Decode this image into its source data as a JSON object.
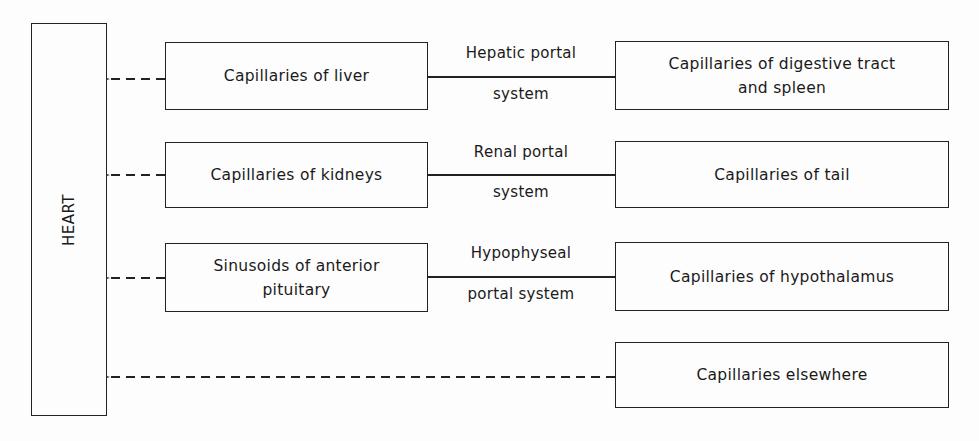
{
  "diagram": {
    "heart": {
      "label": "HEART"
    },
    "rows": [
      {
        "source": "Capillaries of liver",
        "system_top": "Hepatic portal",
        "system_bottom": "system",
        "origin": "Capillaries of digestive tract and spleen"
      },
      {
        "source": "Capillaries of kidneys",
        "system_top": "Renal portal",
        "system_bottom": "system",
        "origin": "Capillaries of tail"
      },
      {
        "source": "Sinusoids of anterior pituitary",
        "system_top": "Hypophyseal",
        "system_bottom": "portal system",
        "origin": "Capillaries of hypothalamus"
      },
      {
        "origin": "Capillaries elsewhere"
      }
    ],
    "colors": {
      "line": "#222222",
      "background": "#fdfdfd"
    }
  }
}
